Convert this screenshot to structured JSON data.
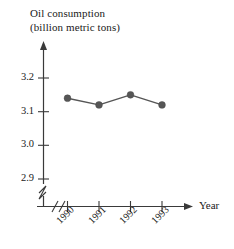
{
  "chart_data": {
    "type": "line",
    "title": "Oil consumption",
    "subtitle": "(billion metric tons)",
    "xlabel": "Year",
    "ylabel": "",
    "categories": [
      "1990",
      "1991",
      "1992",
      "1993"
    ],
    "values": [
      3.14,
      3.12,
      3.15,
      3.12
    ],
    "series": [
      {
        "name": "Oil consumption",
        "values": [
          3.14,
          3.12,
          3.15,
          3.12
        ]
      }
    ],
    "yticks": [
      "3.2",
      "3.1",
      "3.0",
      "2.9"
    ],
    "ytick_values": [
      3.2,
      3.1,
      3.0,
      2.9
    ],
    "ylim": [
      2.9,
      3.2
    ],
    "y_axis_break": true,
    "x_axis_break": true,
    "grid": false,
    "legend": null,
    "marker": "filled-circle",
    "marker_color": "#565656",
    "line_color": "#565656",
    "axis_color": "#3a3a3a",
    "background": "#ffffff"
  },
  "axes": {
    "y_title_line1": "Oil consumption",
    "y_title_line2": "(billion metric tons)",
    "x_axis_name": "Year"
  },
  "ticks": {
    "y": [
      {
        "label": "3.2"
      },
      {
        "label": "3.1"
      },
      {
        "label": "3.0"
      },
      {
        "label": "2.9"
      }
    ],
    "x": [
      {
        "label": "1990"
      },
      {
        "label": "1991"
      },
      {
        "label": "1992"
      },
      {
        "label": "1993"
      }
    ]
  }
}
